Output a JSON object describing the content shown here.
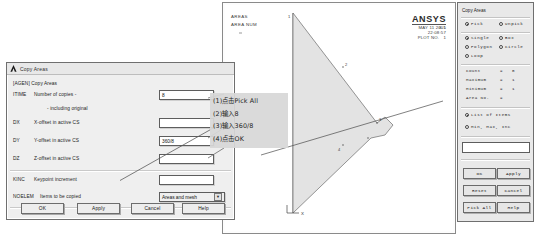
{
  "graphics": {
    "labels": [
      "AREAS",
      "AREA NUM"
    ],
    "brand": "ANSYS",
    "version": "8.1",
    "meta": "MAY 11 2005\n22:08:57\nPLOT NO.   1",
    "axis_x_label": "X",
    "node_labels": [
      "1",
      "2",
      "3",
      "4"
    ]
  },
  "copy_dialog": {
    "title": "Copy Areas",
    "command": "[AGEN]  Copy Areas",
    "fields": [
      {
        "tag": "ITIME",
        "desc": "Number of copies -",
        "value": "8",
        "type": "text"
      },
      {
        "tag": "",
        "desc": "- including original",
        "value": "",
        "type": "none"
      },
      {
        "tag": "DX",
        "desc": "X-offset in active CS",
        "value": "",
        "type": "text"
      },
      {
        "tag": "DY",
        "desc": "Y-offset in active CS",
        "value": "360/8",
        "type": "text"
      },
      {
        "tag": "DZ",
        "desc": "Z-offset in active CS",
        "value": "",
        "type": "text"
      },
      {
        "tag": "KINC",
        "desc": "Keypoint increment",
        "value": "",
        "type": "text"
      },
      {
        "tag": "NOELEM",
        "desc": "Items to be copied",
        "value": "Areas and mesh",
        "type": "select"
      }
    ],
    "buttons": [
      "OK",
      "Apply",
      "Cancel",
      "Help"
    ]
  },
  "annotation": {
    "lines": [
      "(1)点击Pick All",
      "(2)输入8",
      "(3)输入360/8",
      "(4)点击OK"
    ]
  },
  "pick_dialog": {
    "title": "Copy Areas",
    "mode_group": [
      {
        "label": "Pick",
        "selected": true
      },
      {
        "label": "Unpick",
        "selected": false
      }
    ],
    "shape_group": [
      {
        "label": "Single",
        "selected": true
      },
      {
        "label": "Box",
        "selected": false
      },
      {
        "label": "Polygon",
        "selected": false
      },
      {
        "label": "Circle",
        "selected": false
      },
      {
        "label": "Loop",
        "selected": false
      }
    ],
    "counters": [
      {
        "label": "Count",
        "value": "0"
      },
      {
        "label": "Maximum",
        "value": "1"
      },
      {
        "label": "Minimum",
        "value": "1"
      },
      {
        "label": "Area No.",
        "value": ""
      }
    ],
    "list_group": [
      {
        "label": "List of Items",
        "selected": true
      },
      {
        "label": "Min, Max, Inc",
        "selected": false
      }
    ],
    "input_value": "",
    "buttons": [
      "OK",
      "Apply",
      "Reset",
      "Cancel",
      "Pick All",
      "Help"
    ]
  }
}
